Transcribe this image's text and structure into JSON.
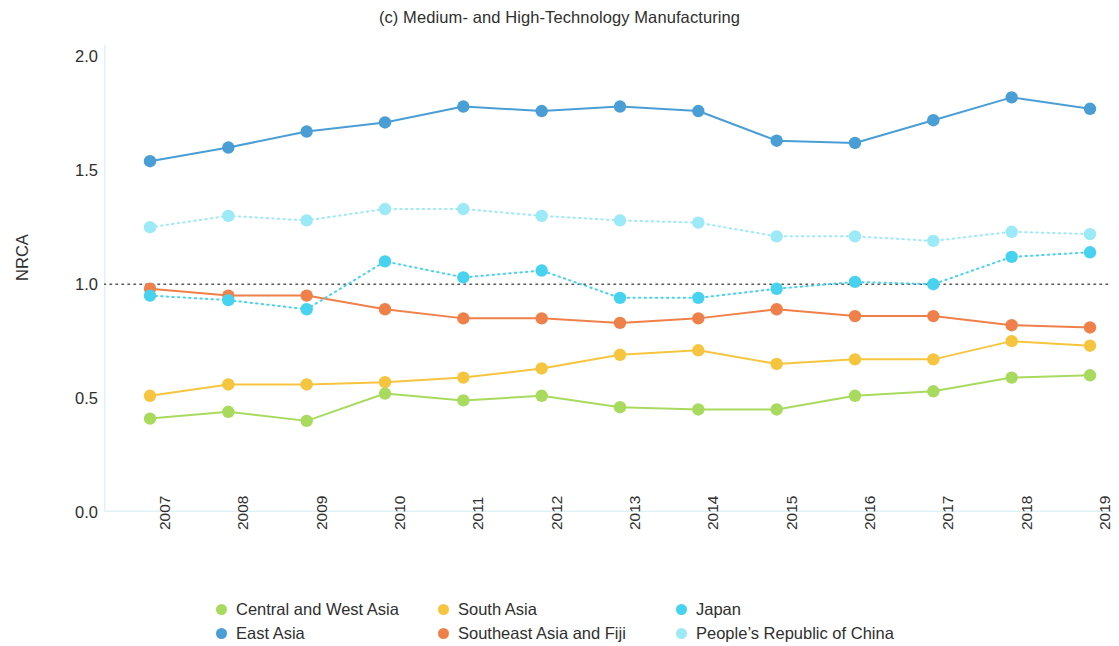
{
  "chart_data": {
    "type": "line",
    "title": "(c) Medium- and High-Technology Manufacturing",
    "xlabel": "",
    "ylabel": "NRCA",
    "categories": [
      "2007",
      "2008",
      "2009",
      "2010",
      "2011",
      "2012",
      "2013",
      "2014",
      "2015",
      "2016",
      "2017",
      "2018",
      "2019"
    ],
    "x": [
      2007,
      2008,
      2009,
      2010,
      2011,
      2012,
      2013,
      2014,
      2015,
      2016,
      2017,
      2018,
      2019
    ],
    "ylim": [
      0.0,
      2.05
    ],
    "yticks": [
      "0.0",
      "0.5",
      "1.0",
      "1.5",
      "2.0"
    ],
    "ytick_values": [
      0.0,
      0.5,
      1.0,
      1.5,
      2.0
    ],
    "grid": false,
    "reference_line": {
      "value": 1.0,
      "style": "dotted",
      "color": "#555555"
    },
    "legend_position": "bottom",
    "series": [
      {
        "name": "Central and West Asia",
        "color": "#a8da5e",
        "style": "solid",
        "values": [
          0.41,
          0.44,
          0.4,
          0.52,
          0.49,
          0.51,
          0.46,
          0.45,
          0.45,
          0.51,
          0.53,
          0.59,
          0.6
        ]
      },
      {
        "name": "East Asia",
        "color": "#4a9ed6",
        "style": "solid",
        "values": [
          1.54,
          1.6,
          1.67,
          1.71,
          1.78,
          1.76,
          1.78,
          1.76,
          1.63,
          1.62,
          1.72,
          1.82,
          1.77
        ]
      },
      {
        "name": "South Asia",
        "color": "#f6c53f",
        "style": "solid",
        "values": [
          0.51,
          0.56,
          0.56,
          0.57,
          0.59,
          0.63,
          0.69,
          0.71,
          0.65,
          0.67,
          0.67,
          0.75,
          0.73
        ]
      },
      {
        "name": "Southeast Asia and Fiji",
        "color": "#f0804a",
        "style": "solid",
        "values": [
          0.98,
          0.95,
          0.95,
          0.89,
          0.85,
          0.85,
          0.83,
          0.85,
          0.89,
          0.86,
          0.86,
          0.82,
          0.81
        ]
      },
      {
        "name": "Japan",
        "color": "#47d2ef",
        "style": "dotted",
        "values": [
          0.95,
          0.93,
          0.89,
          1.1,
          1.03,
          1.06,
          0.94,
          0.94,
          0.98,
          1.01,
          1.0,
          1.12,
          1.14
        ]
      },
      {
        "name": "People’s Republic of China",
        "color": "#9ce9f8",
        "style": "dotted",
        "values": [
          1.25,
          1.3,
          1.28,
          1.33,
          1.33,
          1.3,
          1.28,
          1.27,
          1.21,
          1.21,
          1.19,
          1.23,
          1.22
        ]
      }
    ]
  },
  "legend": {
    "items": [
      {
        "label": "Central and West Asia",
        "color": "#a8da5e"
      },
      {
        "label": "South Asia",
        "color": "#f6c53f"
      },
      {
        "label": "Japan",
        "color": "#47d2ef"
      },
      {
        "label": "East Asia",
        "color": "#4a9ed6"
      },
      {
        "label": "Southeast Asia and Fiji",
        "color": "#f0804a"
      },
      {
        "label": "People’s Republic of China",
        "color": "#9ce9f8"
      }
    ]
  }
}
